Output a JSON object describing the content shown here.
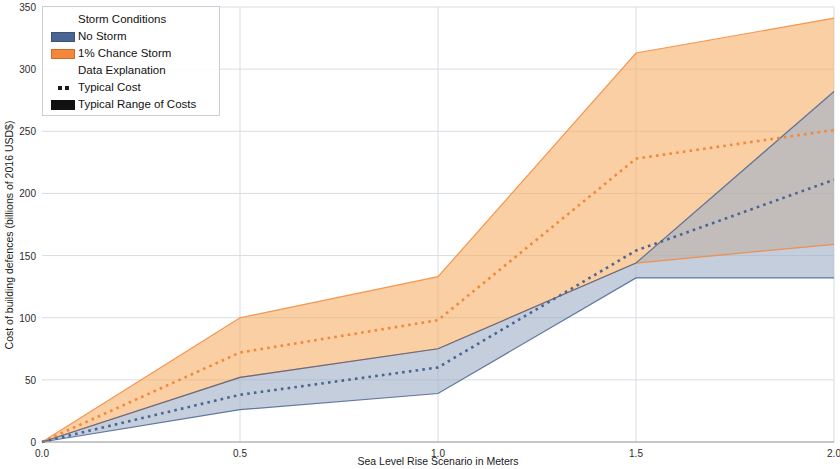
{
  "legend": {
    "groups": [
      {
        "heading": "Storm Conditions",
        "entries": [
          {
            "label": "No Storm",
            "swatch": "patch",
            "color": "#4a6591"
          },
          {
            "label": "1% Chance Storm",
            "swatch": "patch",
            "color": "#f4873a"
          }
        ]
      },
      {
        "heading": "Data Explanation",
        "entries": [
          {
            "label": "Typical Cost",
            "swatch": "dotted",
            "color": "#1a1a1a"
          },
          {
            "label": "Typical Range of Costs",
            "swatch": "solid",
            "color": "#111111"
          }
        ]
      }
    ]
  },
  "chart_data": {
    "type": "area",
    "title": "",
    "xlabel": "Sea Level Rise Scenario in Meters",
    "ylabel": "Cost of building defences (billions of 2016 USD$)",
    "x": [
      0.0,
      0.5,
      1.0,
      1.5,
      2.0
    ],
    "xlim": [
      0.0,
      2.0
    ],
    "ylim": [
      0,
      350
    ],
    "xticks": [
      0.0,
      0.5,
      1.0,
      1.5,
      2.0
    ],
    "xticklabels": [
      "0.0",
      "0.5",
      "1.0",
      "1.5",
      "2.0"
    ],
    "yticks": [
      0,
      50,
      100,
      150,
      200,
      250,
      300,
      350
    ],
    "yticklabels": [
      "0",
      "50",
      "100",
      "150",
      "200",
      "250",
      "300",
      "350"
    ],
    "grid": true,
    "legend_position": "upper left",
    "series": [
      {
        "name": "1% Chance Storm",
        "color": "#f4873a",
        "band_fill": "#f6b26b",
        "band_opacity": 0.62,
        "typical": [
          0,
          72,
          98,
          228,
          251
        ],
        "upper": [
          0,
          100,
          133,
          313,
          341
        ],
        "lower": [
          0,
          52,
          75,
          144,
          159
        ]
      },
      {
        "name": "No Storm",
        "color": "#4a6591",
        "band_fill": "#9fb0c8",
        "band_opacity": 0.62,
        "typical": [
          0,
          38,
          60,
          154,
          211
        ],
        "upper": [
          0,
          52,
          75,
          144,
          282
        ],
        "lower": [
          0,
          26,
          39,
          132,
          132
        ]
      }
    ]
  }
}
